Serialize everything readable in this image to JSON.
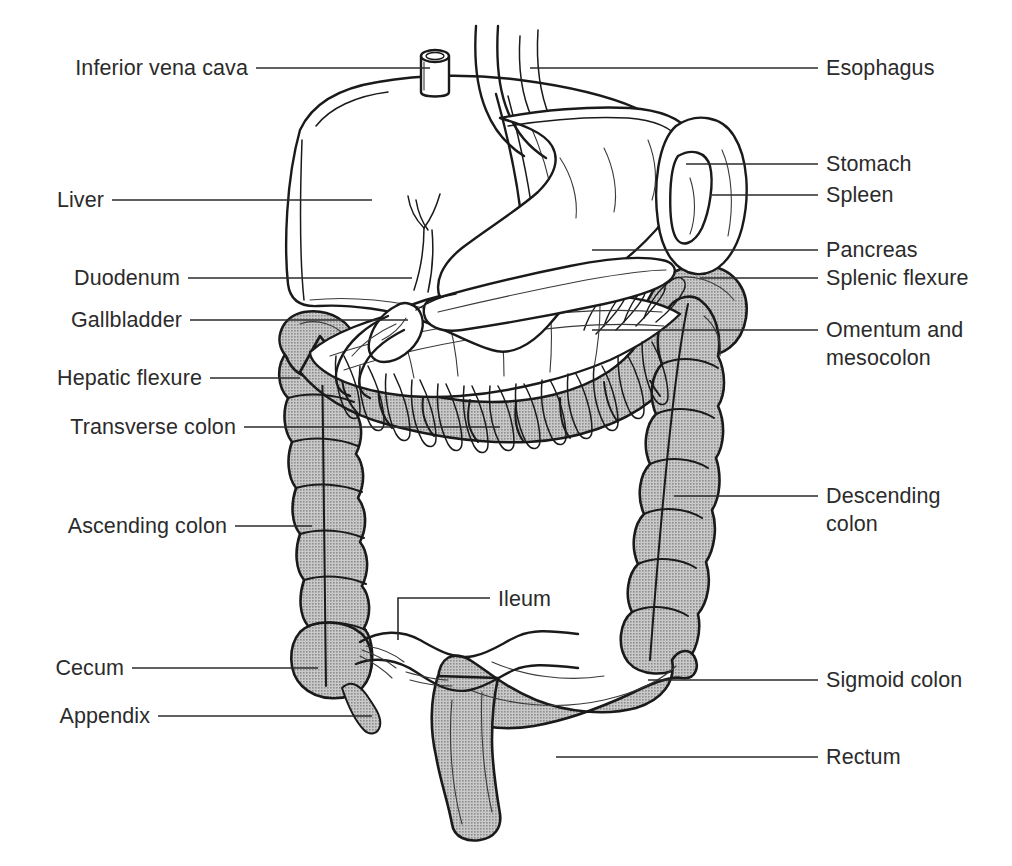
{
  "figure": {
    "background_color": "#ffffff",
    "line_color": "#1a1a1a",
    "text_color": "#2b2b2b",
    "organ_fill_gray": "#b4b4b4",
    "organ_fill_white": "#ffffff"
  },
  "labels_left": [
    {
      "id": "inferior-vena-cava",
      "text": "Inferior vena cava",
      "text_x": 248,
      "text_y": 75,
      "leader": "M256,68 L430,68"
    },
    {
      "id": "liver",
      "text": "Liver",
      "text_x": 104,
      "text_y": 207,
      "leader": "M112,200 L372,200"
    },
    {
      "id": "duodenum",
      "text": "Duodenum",
      "text_x": 180,
      "text_y": 285,
      "leader": "M188,278 L412,278"
    },
    {
      "id": "gallbladder",
      "text": "Gallbladder",
      "text_x": 182,
      "text_y": 327,
      "leader": "M190,320 L408,320"
    },
    {
      "id": "hepatic-flexure",
      "text": "Hepatic flexure",
      "text_x": 202,
      "text_y": 385,
      "leader": "M210,378 L300,378"
    },
    {
      "id": "transverse-colon",
      "text": "Transverse colon",
      "text_x": 236,
      "text_y": 434,
      "leader": "M244,427 L500,427"
    },
    {
      "id": "ascending-colon",
      "text": "Ascending colon",
      "text_x": 227,
      "text_y": 533,
      "leader": "M235,526 L312,526"
    },
    {
      "id": "cecum",
      "text": "Cecum",
      "text_x": 124,
      "text_y": 675,
      "leader": "M132,668 L318,668"
    },
    {
      "id": "appendix",
      "text": "Appendix",
      "text_x": 150,
      "text_y": 723,
      "leader": "M158,716 L372,716"
    }
  ],
  "labels_right": [
    {
      "id": "esophagus",
      "text": "Esophagus",
      "text_x": 826,
      "text_y": 75,
      "leader": "M530,68 L818,68"
    },
    {
      "id": "stomach",
      "text": "Stomach",
      "text_x": 826,
      "text_y": 171,
      "leader": "M686,164 L818,164"
    },
    {
      "id": "spleen",
      "text": "Spleen",
      "text_x": 826,
      "text_y": 202,
      "leader": "M712,195 L818,195"
    },
    {
      "id": "pancreas",
      "text": "Pancreas",
      "text_x": 826,
      "text_y": 257,
      "leader": "M592,250 L818,250"
    },
    {
      "id": "splenic-flexure",
      "text": "Splenic flexure",
      "text_x": 826,
      "text_y": 285,
      "leader": "M700,278 L818,278"
    },
    {
      "id": "omentum-line1",
      "text": "Omentum and",
      "text_x": 826,
      "text_y": 337,
      "leader": "M592,330 L818,330"
    },
    {
      "id": "omentum-line2",
      "text": "mesocolon",
      "text_x": 826,
      "text_y": 365,
      "leader": ""
    },
    {
      "id": "descending-colon-line1",
      "text": "Descending",
      "text_x": 826,
      "text_y": 503,
      "leader": "M674,496 L818,496"
    },
    {
      "id": "descending-colon-line2",
      "text": "colon",
      "text_x": 826,
      "text_y": 531,
      "leader": ""
    },
    {
      "id": "sigmoid-colon",
      "text": "Sigmoid colon",
      "text_x": 826,
      "text_y": 687,
      "leader": "M648,680 L818,680"
    },
    {
      "id": "rectum",
      "text": "Rectum",
      "text_x": 826,
      "text_y": 764,
      "leader": "M556,757 L818,757"
    }
  ],
  "labels_inner": [
    {
      "id": "ileum",
      "text": "Ileum",
      "text_x": 498,
      "text_y": 606,
      "leader": "M398,640 L398,598 L490,598"
    }
  ],
  "organs": [
    {
      "id": "liver",
      "fill": "white",
      "note": "large lobed organ upper left"
    },
    {
      "id": "stomach",
      "fill": "white",
      "note": "curved sac center right under liver"
    },
    {
      "id": "spleen",
      "fill": "white",
      "note": "oval organ far right upper"
    },
    {
      "id": "inferior-vena-cava",
      "fill": "white",
      "note": "short vertical cylinder at liver apex"
    },
    {
      "id": "esophagus",
      "fill": "white",
      "note": "vertical tube entering stomach"
    },
    {
      "id": "gallbladder",
      "fill": "white",
      "note": "small pear shape under liver"
    },
    {
      "id": "duodenum",
      "fill": "white",
      "note": "C-loop below liver"
    },
    {
      "id": "pancreas",
      "fill": "white",
      "note": "elongated organ behind stomach"
    },
    {
      "id": "omentum-mesocolon",
      "fill": "white",
      "note": "fringed apron over transverse colon"
    },
    {
      "id": "hepatic-flexure",
      "fill": "gray",
      "note": "right colonic bend"
    },
    {
      "id": "splenic-flexure",
      "fill": "gray",
      "note": "left colonic bend"
    },
    {
      "id": "transverse-colon",
      "fill": "gray",
      "note": "horizontal haustrated segment"
    },
    {
      "id": "ascending-colon",
      "fill": "gray",
      "note": "vertical haustrated segment left"
    },
    {
      "id": "descending-colon",
      "fill": "gray",
      "note": "vertical haustrated segment right"
    },
    {
      "id": "cecum",
      "fill": "gray",
      "note": "pouch at base of ascending colon"
    },
    {
      "id": "appendix",
      "fill": "gray",
      "note": "thin tail from cecum"
    },
    {
      "id": "ileum",
      "fill": "white",
      "note": "small intestine loop entering cecum"
    },
    {
      "id": "sigmoid-colon",
      "fill": "gray",
      "note": "S-shaped segment lower center"
    },
    {
      "id": "rectum",
      "fill": "gray",
      "note": "terminal segment descending to bottom"
    }
  ]
}
